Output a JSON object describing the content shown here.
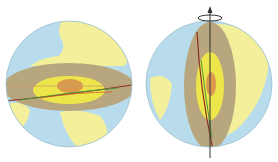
{
  "figure": {
    "globes": [
      {
        "name": "equatorial-section-globe",
        "orientation": "horizontal"
      },
      {
        "name": "meridional-section-globe",
        "orientation": "vertical",
        "rotation_axis": true
      }
    ],
    "colors": {
      "ocean": "#b9dcec",
      "land": "#f3ef9a",
      "mantle": "#b8a67e",
      "outer_core": "#ede64a",
      "inner_core": "#d99a4e",
      "line_red": "#c0392b",
      "line_green": "#4a9a3a",
      "axis": "#333333"
    }
  }
}
